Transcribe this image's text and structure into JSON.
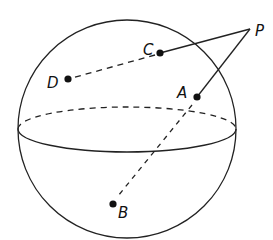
{
  "diagram": {
    "labels": {
      "P": "P",
      "A": "A",
      "B": "B",
      "C": "C",
      "D": "D"
    },
    "colors": {
      "stroke": "#222222",
      "background": "#ffffff"
    }
  }
}
